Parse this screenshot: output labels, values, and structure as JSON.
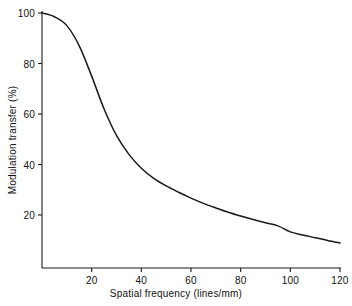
{
  "chart_data": {
    "type": "line",
    "title": "",
    "xlabel": "Spatial frequency (lines/mm)",
    "ylabel": "Modulation transfer (%)",
    "xlim": [
      0,
      120
    ],
    "ylim": [
      0,
      100
    ],
    "grid": false,
    "legend": "none",
    "x_ticks": [
      20,
      40,
      60,
      80,
      100,
      120
    ],
    "y_ticks": [
      20,
      40,
      60,
      80,
      100
    ],
    "x_tick_labels": [
      "20",
      "40",
      "60",
      "80",
      "100",
      "120"
    ],
    "y_tick_labels": [
      "20",
      "40",
      "60",
      "80",
      "100"
    ],
    "series": [
      {
        "name": "Modulation transfer function",
        "color": "#1a1a1a",
        "x": [
          0,
          5,
          10,
          15,
          20,
          25,
          30,
          35,
          40,
          45,
          50,
          55,
          60,
          65,
          70,
          75,
          80,
          85,
          90,
          95,
          100,
          105,
          110,
          115,
          120
        ],
        "values": [
          100,
          98.5,
          95,
          87,
          75,
          62,
          51.5,
          44,
          38.5,
          34.5,
          31.5,
          29,
          26.7,
          24.6,
          22.8,
          21.1,
          19.6,
          18.2,
          16.9,
          15.7,
          13.3,
          12.1,
          11.0,
          9.9,
          8.9
        ]
      }
    ]
  },
  "axes": {
    "x_tick_positions_px": [
      90,
      140,
      190,
      240,
      290,
      340
    ],
    "y_tick_positions_px": [
      215,
      164.5,
      114,
      63.5,
      13
    ],
    "origin_px": {
      "x": 42,
      "y": 265.5
    }
  }
}
